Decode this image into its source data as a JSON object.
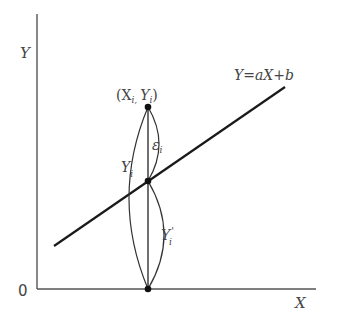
{
  "diagram": {
    "type": "linear-regression-residual",
    "axes": {
      "y_label": "Y",
      "x_label": "X",
      "origin_label": "0"
    },
    "regression_line": {
      "equation": "Y=aX+b"
    },
    "points": {
      "observed": "(X",
      "observed_sub_x": "i,",
      "observed_y": "Y",
      "observed_sub_y": "i",
      "observed_close": ")"
    },
    "braces": {
      "residual": "ε",
      "residual_sub": "i",
      "observed_value": "Y",
      "observed_value_sub": "i",
      "predicted_value": "Y",
      "predicted_value_sub": "i",
      "predicted_prime": "'"
    },
    "colors": {
      "axis": "#555555",
      "line": "#1a1a1a",
      "dot": "#111111",
      "text": "#444444"
    }
  }
}
